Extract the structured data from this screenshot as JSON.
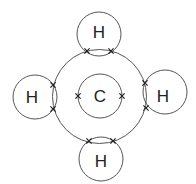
{
  "diagram": {
    "center_atom": {
      "symbol": "C",
      "inner_shell": {
        "cx": 100,
        "cy": 96,
        "r": 22
      },
      "inner_electrons": [
        {
          "x": 78,
          "y": 96
        },
        {
          "x": 122,
          "y": 96
        }
      ]
    },
    "outer_shell": {
      "cx": 99.5,
      "cy": 96.5,
      "r": 47
    },
    "hydrogens": [
      {
        "position": "top",
        "symbol": "H",
        "cx": 99,
        "cy": 34,
        "r": 22,
        "label_x": 99,
        "label_y": 32,
        "shared_electrons": [
          {
            "x": 87,
            "y": 51
          },
          {
            "x": 111,
            "y": 51
          }
        ]
      },
      {
        "position": "left",
        "symbol": "H",
        "cx": 35,
        "cy": 97,
        "r": 22,
        "label_x": 32,
        "label_y": 97,
        "shared_electrons": [
          {
            "x": 53,
            "y": 85
          },
          {
            "x": 53,
            "y": 109
          }
        ]
      },
      {
        "position": "right",
        "symbol": "H",
        "cx": 165,
        "cy": 92,
        "r": 22,
        "label_x": 163,
        "label_y": 96,
        "shared_electrons": [
          {
            "x": 145,
            "y": 83
          },
          {
            "x": 146,
            "y": 108
          }
        ]
      },
      {
        "position": "bottom",
        "symbol": "H",
        "cx": 101,
        "cy": 159,
        "r": 22,
        "label_x": 101,
        "label_y": 161,
        "shared_electrons": [
          {
            "x": 89,
            "y": 141
          },
          {
            "x": 113,
            "y": 141
          }
        ]
      }
    ],
    "electron_marker": "cross",
    "stroke_color": "#555555",
    "text_color": "#222222"
  }
}
